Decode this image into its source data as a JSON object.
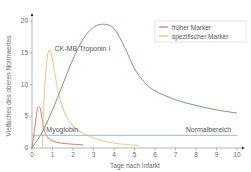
{
  "chart_data": {
    "type": "line",
    "title": "",
    "xlabel": "Tage nach Infarkt",
    "ylabel": "Vielfaches des oberen Normwertes",
    "xlim": [
      0,
      10
    ],
    "ylim": [
      0,
      20
    ],
    "x_ticks": [
      "0",
      "1",
      "2",
      "3",
      "4",
      "5",
      "6",
      "7",
      "8",
      "9",
      "10"
    ],
    "y_ticks": [
      "0",
      "5",
      "10",
      "15",
      "20"
    ],
    "grid": false,
    "legend_position": "upper right",
    "legend": [
      {
        "label": "früher Marker",
        "color": "#d9785a"
      },
      {
        "label": "spezifischer Marker",
        "color": "#f0d9a0"
      }
    ],
    "series": [
      {
        "name": "Myoglobin",
        "category": "früher Marker",
        "color": "#d97a5c",
        "points": [
          [
            0,
            0
          ],
          [
            0.15,
            3.5
          ],
          [
            0.25,
            6.0
          ],
          [
            0.33,
            6.5
          ],
          [
            0.42,
            6.0
          ],
          [
            0.55,
            3.5
          ],
          [
            0.7,
            2.0
          ],
          [
            0.9,
            1.3
          ],
          [
            1.2,
            0.9
          ],
          [
            1.6,
            0.7
          ],
          [
            2.0,
            0.6
          ],
          [
            2.5,
            0.5
          ]
        ]
      },
      {
        "name": "CK-MB",
        "category": "spezifischer Marker",
        "color": "#f2c98e",
        "points": [
          [
            0.5,
            0
          ],
          [
            0.55,
            5.0
          ],
          [
            0.65,
            11.0
          ],
          [
            0.75,
            14.5
          ],
          [
            0.85,
            15.4
          ],
          [
            0.95,
            14.8
          ],
          [
            1.1,
            12.0
          ],
          [
            1.3,
            8.5
          ],
          [
            1.6,
            5.5
          ],
          [
            2.0,
            3.5
          ],
          [
            2.5,
            2.3
          ],
          [
            3.0,
            1.6
          ],
          [
            3.5,
            1.1
          ],
          [
            4.0,
            0.8
          ],
          [
            4.5,
            0.6
          ],
          [
            5.2,
            0.4
          ]
        ]
      },
      {
        "name": "Troponin I",
        "category": "spezifischer Marker",
        "color": "#5a9a5a",
        "points": [
          [
            0,
            0
          ],
          [
            0.5,
            2.5
          ],
          [
            1.0,
            6.0
          ],
          [
            1.5,
            10.0
          ],
          [
            2.0,
            14.0
          ],
          [
            2.5,
            17.2
          ],
          [
            3.0,
            19.0
          ],
          [
            3.5,
            19.5
          ],
          [
            4.0,
            18.8
          ],
          [
            4.5,
            16.0
          ],
          [
            5.0,
            12.5
          ],
          [
            5.5,
            10.3
          ],
          [
            6.0,
            9.0
          ],
          [
            7.0,
            7.6
          ],
          [
            8.0,
            6.7
          ],
          [
            9.0,
            6.0
          ],
          [
            10.0,
            5.5
          ]
        ]
      },
      {
        "name": "Normalbereich",
        "color": "#8fb0d6",
        "points": [
          [
            0,
            2.0
          ],
          [
            10,
            2.0
          ]
        ]
      }
    ],
    "annotations": [
      {
        "text": "CK-MB",
        "x": 1.1,
        "y": 15.2
      },
      {
        "text": "Troponin I",
        "x": 2.3,
        "y": 15.2
      },
      {
        "text": "Myoglobin",
        "x": 0.7,
        "y": 2.5
      },
      {
        "text": "Normalbereich",
        "x": 7.5,
        "y": 2.5
      }
    ]
  }
}
